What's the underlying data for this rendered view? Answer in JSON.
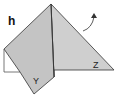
{
  "diagram": {
    "step_label": "h",
    "flap_labels": {
      "left": "Y",
      "right": "Z"
    },
    "colors": {
      "paper": "#c8c8c8",
      "paper_light": "#d4d4d4",
      "outline": "#333333",
      "background": "#ffffff"
    },
    "arrow": {
      "direction": "up-right",
      "meaning": "fold-back"
    }
  }
}
